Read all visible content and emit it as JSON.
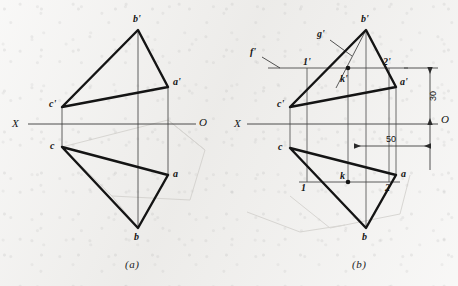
{
  "figure": {
    "title_a": "(a)",
    "title_b": "(b)",
    "axis": {
      "left_label": "X",
      "right_label": "O"
    },
    "panel_a": {
      "name": "projection-without-construction",
      "vertices": [
        {
          "id": "b-prime",
          "label": "b'",
          "x": 138,
          "y": 30
        },
        {
          "id": "a-prime",
          "label": "a'",
          "x": 168,
          "y": 87
        },
        {
          "id": "c-prime",
          "label": "c'",
          "x": 62,
          "y": 107
        },
        {
          "id": "c",
          "label": "c",
          "x": 62,
          "y": 147
        },
        {
          "id": "a",
          "label": "a",
          "x": 168,
          "y": 175
        },
        {
          "id": "b",
          "label": "b",
          "x": 138,
          "y": 228
        }
      ]
    },
    "panel_b": {
      "name": "projection-with-construction",
      "vertices": [
        {
          "id": "b-prime",
          "label": "b'",
          "x": 366,
          "y": 30
        },
        {
          "id": "a-prime",
          "label": "a'",
          "x": 396,
          "y": 87
        },
        {
          "id": "c-prime",
          "label": "c'",
          "x": 290,
          "y": 107
        },
        {
          "id": "c",
          "label": "c",
          "x": 290,
          "y": 148
        },
        {
          "id": "a",
          "label": "a",
          "x": 396,
          "y": 175
        },
        {
          "id": "b",
          "label": "b",
          "x": 366,
          "y": 228
        }
      ],
      "construction_labels": [
        {
          "id": "f-prime",
          "label": "f'",
          "x": 254,
          "y": 52
        },
        {
          "id": "g-prime",
          "label": "g'",
          "x": 321,
          "y": 34
        },
        {
          "id": "one-prime",
          "label": "1'",
          "x": 309,
          "y": 62
        },
        {
          "id": "two-prime",
          "label": "2'",
          "x": 383,
          "y": 62
        },
        {
          "id": "k-prime",
          "label": "k'",
          "x": 341,
          "y": 79
        },
        {
          "id": "one",
          "label": "1",
          "x": 307,
          "y": 188
        },
        {
          "id": "two",
          "label": "2",
          "x": 385,
          "y": 188
        },
        {
          "id": "k",
          "label": "k",
          "x": 340,
          "y": 180
        }
      ],
      "dimensions": [
        {
          "id": "dim-vertical-30",
          "value": "30",
          "orientation": "vertical",
          "x": 436,
          "y": 96
        },
        {
          "id": "dim-horizontal-50",
          "value": "50",
          "orientation": "horizontal",
          "x": 389,
          "y": 140
        }
      ]
    }
  }
}
